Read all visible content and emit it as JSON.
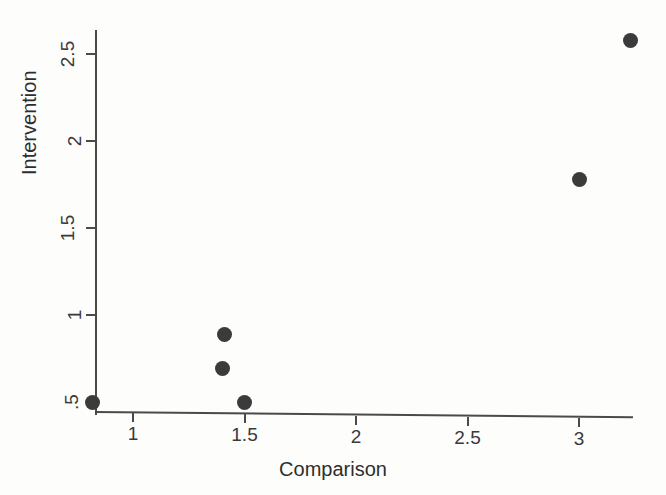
{
  "chart_data": {
    "type": "scatter",
    "title": "",
    "xlabel": "Comparison",
    "ylabel": "Intervention",
    "xlim": [
      0.72,
      3.38
    ],
    "ylim": [
      0.45,
      2.72
    ],
    "grid": false,
    "legend": null,
    "xticks": [
      {
        "value": 1,
        "label": "1"
      },
      {
        "value": 1.5,
        "label": "1.5"
      },
      {
        "value": 2,
        "label": "2"
      },
      {
        "value": 2.5,
        "label": "2.5"
      },
      {
        "value": 3,
        "label": "3"
      }
    ],
    "yticks": [
      {
        "value": 0.5,
        "label": ".5"
      },
      {
        "value": 1,
        "label": "1"
      },
      {
        "value": 1.5,
        "label": "1.5"
      },
      {
        "value": 2,
        "label": "2"
      },
      {
        "value": 2.5,
        "label": "2.5"
      }
    ],
    "points": [
      {
        "x": 0.82,
        "y": 0.5
      },
      {
        "x": 1.41,
        "y": 0.89
      },
      {
        "x": 1.4,
        "y": 0.69
      },
      {
        "x": 1.5,
        "y": 0.5
      },
      {
        "x": 3.0,
        "y": 1.78
      },
      {
        "x": 3.23,
        "y": 2.58
      }
    ],
    "marker": {
      "shape": "circle",
      "color": "#3b3b3b",
      "size_px": 15
    }
  },
  "axes": {
    "x_title": "Comparison",
    "y_title": "Intervention"
  },
  "colors": {
    "background": "#fdfdfc",
    "axis": "#4a4a4a",
    "text": "#2e2e2e",
    "marker": "#3b3b3b"
  }
}
